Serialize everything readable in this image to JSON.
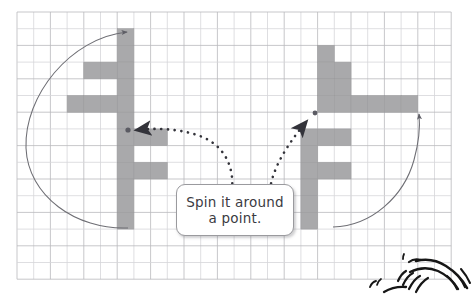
{
  "figure": {
    "background_color": "#ffffff"
  },
  "grid": {
    "x": 17,
    "y": 12,
    "width": 433,
    "height": 260,
    "cell_size": 16.7,
    "line_color": "#b9b9bd",
    "minor_line_color": "#d5d5d9",
    "columns": 26,
    "rows": 16
  },
  "shapes": {
    "fill_color": "#a9a9ab",
    "stroke_color": "#9a9a9c",
    "left_group": {
      "name": "left-shape-pair",
      "rotated_figure": {
        "name": "left-rotated-f",
        "rotation_degrees": 180,
        "cells": [
          [
            6,
            1
          ],
          [
            6,
            2
          ],
          [
            6,
            3
          ],
          [
            6,
            4
          ],
          [
            6,
            5
          ],
          [
            6,
            6
          ],
          [
            4,
            3
          ],
          [
            5,
            3
          ],
          [
            3,
            5
          ],
          [
            4,
            5
          ],
          [
            5,
            5
          ]
        ]
      },
      "original_figure": {
        "name": "left-upright-f",
        "rotation_degrees": 0,
        "cells": [
          [
            6,
            7
          ],
          [
            6,
            8
          ],
          [
            6,
            9
          ],
          [
            6,
            10
          ],
          [
            6,
            11
          ],
          [
            6,
            12
          ],
          [
            7,
            7
          ],
          [
            8,
            7
          ],
          [
            7,
            9
          ],
          [
            8,
            9
          ]
        ]
      },
      "pivot": {
        "x": 128,
        "y": 130
      }
    },
    "right_group": {
      "name": "right-shape-pair",
      "rotated_figure": {
        "name": "right-rotated-f",
        "rotation_degrees": 90,
        "cells": [
          [
            18,
            2
          ],
          [
            18,
            3
          ],
          [
            18,
            4
          ],
          [
            19,
            3
          ],
          [
            19,
            4
          ],
          [
            18,
            5
          ],
          [
            19,
            5
          ],
          [
            20,
            5
          ],
          [
            21,
            5
          ],
          [
            22,
            5
          ],
          [
            23,
            5
          ]
        ]
      },
      "original_figure": {
        "name": "right-upright-f",
        "rotation_degrees": 0,
        "cells": [
          [
            17,
            7
          ],
          [
            17,
            8
          ],
          [
            17,
            9
          ],
          [
            17,
            10
          ],
          [
            17,
            11
          ],
          [
            17,
            12
          ],
          [
            18,
            7
          ],
          [
            19,
            7
          ],
          [
            18,
            9
          ],
          [
            19,
            9
          ]
        ]
      },
      "pivot": {
        "x": 315,
        "y": 113
      }
    }
  },
  "rotation_arcs": {
    "stroke_color": "#6e6e74",
    "left_arc": {
      "name": "left-rotation-arc",
      "direction": "counterclockwise",
      "arrow_at": "top"
    },
    "right_arc": {
      "name": "right-rotation-arc",
      "direction": "counterclockwise",
      "arrow_at": "top"
    }
  },
  "pointer_curves": {
    "stroke_color": "#3c3c42",
    "style": "dashed",
    "left_pointer": {
      "name": "left-pointer-curve",
      "target": "left-pivot-dot"
    },
    "right_pointer": {
      "name": "right-pointer-curve",
      "target": "right-pivot-dot"
    }
  },
  "callout": {
    "lines": [
      "Spin it around",
      "a point."
    ],
    "x": 176,
    "y": 184,
    "width": 118,
    "height": 52,
    "background": "#ffffff",
    "border_color": "#9a9a9e"
  },
  "doodle": {
    "name": "hand-drawn-doodle",
    "stroke_color": "#1c1c1c",
    "description": "hand-sketched swirl in bottom-right corner, partially cropped"
  }
}
